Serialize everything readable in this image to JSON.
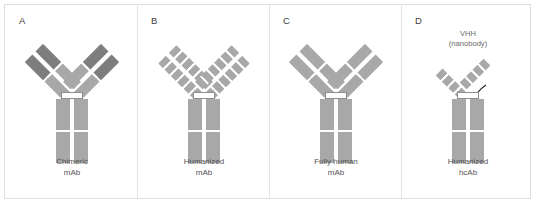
{
  "figure": {
    "type": "antibody-format-diagram",
    "background": "#ffffff",
    "border_color": "#dedede",
    "colors": {
      "light_gray": "#a8a8a8",
      "dark_gray": "#7d7d7d",
      "linker_stroke": "#1f1f1f",
      "caption_text": "#545454",
      "letter_text": "#3b3b3b"
    }
  },
  "panels": [
    {
      "letter": "A",
      "caption": "Chimeric\nmAb",
      "note": "",
      "arm_style": "two-domain",
      "arm_segments_inner": [
        {
          "shade": "dark",
          "length": 26
        },
        {
          "shade": "light",
          "length": 26
        }
      ],
      "arm_segments_outer": [
        {
          "shade": "dark",
          "length": 26
        },
        {
          "shade": "light",
          "length": 26
        }
      ]
    },
    {
      "letter": "B",
      "caption": "Humanized\nmAb",
      "note": "",
      "arm_style": "segmented-cdr-graft",
      "arm_segments_inner": [
        {
          "shade": "light",
          "length": 7
        },
        {
          "shade": "light",
          "length": 7
        },
        {
          "shade": "light",
          "length": 7
        },
        {
          "shade": "light",
          "length": 7
        },
        {
          "shade": "light",
          "length": 7
        },
        {
          "shade": "light",
          "length": 7
        }
      ],
      "arm_segments_outer": [
        {
          "shade": "light",
          "length": 7
        },
        {
          "shade": "light",
          "length": 7
        },
        {
          "shade": "light",
          "length": 7
        },
        {
          "shade": "light",
          "length": 7
        },
        {
          "shade": "light",
          "length": 7
        },
        {
          "shade": "light",
          "length": 7
        }
      ]
    },
    {
      "letter": "C",
      "caption": "Fully human\nmAb",
      "note": "",
      "arm_style": "two-domain-uniform",
      "arm_segments_inner": [
        {
          "shade": "light",
          "length": 26
        },
        {
          "shade": "light",
          "length": 26
        }
      ],
      "arm_segments_outer": [
        {
          "shade": "light",
          "length": 26
        },
        {
          "shade": "light",
          "length": 26
        }
      ]
    },
    {
      "letter": "D",
      "caption": "Humanized\nhcAb",
      "note": "VHH\n(nanobody)",
      "arm_style": "single-domain-segmented",
      "arm_segments_inner": [
        {
          "shade": "light",
          "length": 7
        },
        {
          "shade": "light",
          "length": 7
        },
        {
          "shade": "light",
          "length": 7
        },
        {
          "shade": "light",
          "length": 7
        }
      ],
      "arm_segments_outer": []
    }
  ]
}
